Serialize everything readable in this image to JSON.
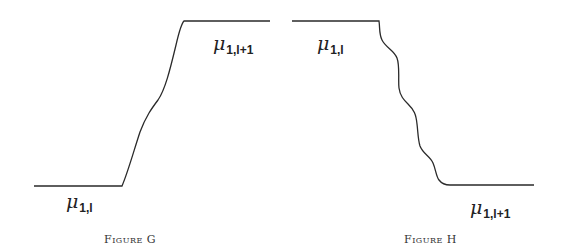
{
  "figures": [
    {
      "id": "G",
      "caption": "Figure G",
      "labels": {
        "low": {
          "symbol": "μ",
          "subscript": "1,l"
        },
        "high": {
          "symbol": "μ",
          "subscript": "1,l+1"
        }
      },
      "description": "Monotone increasing transition from μ_{1,l} (low plateau, left) to μ_{1,l+1} (high plateau, right) with one inflection bump"
    },
    {
      "id": "H",
      "caption": "Figure H",
      "labels": {
        "high": {
          "symbol": "μ",
          "subscript": "1,l"
        },
        "low": {
          "symbol": "μ",
          "subscript": "1,l+1"
        }
      },
      "description": "Wavy decreasing transition from μ_{1,l} (high plateau, left) to μ_{1,l+1} (low plateau, right)"
    }
  ],
  "colors": {
    "line": "#2a2a2a",
    "background": "#ffffff"
  }
}
